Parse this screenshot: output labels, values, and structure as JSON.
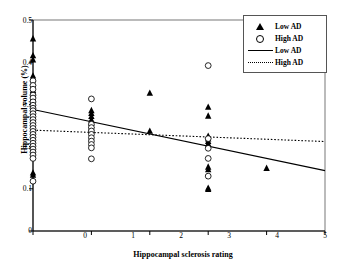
{
  "chart_data": {
    "type": "scatter",
    "title": "",
    "xlabel": "Hippocampal sclerosis rating",
    "ylabel": "Hippocampal volume (%)",
    "xlim": [
      0,
      5
    ],
    "ylim": [
      0,
      0.5
    ],
    "xticks": [
      "0",
      "1",
      "2",
      "3",
      "4",
      "5"
    ],
    "yticks": [
      "0",
      "0.1",
      "0.2",
      "0.3",
      "0.4",
      "0.5"
    ],
    "grid": false,
    "legend_position": "top-right",
    "legend": [
      {
        "label": "Low AD",
        "marker": "filled-triangle",
        "kind": "marker"
      },
      {
        "label": "High AD",
        "marker": "open-circle",
        "kind": "marker"
      },
      {
        "label": "Low AD",
        "marker": "solid-line",
        "kind": "line"
      },
      {
        "label": "High AD",
        "marker": "dotted-line",
        "kind": "line"
      }
    ],
    "series": [
      {
        "name": "Low AD",
        "marker": "filled-triangle",
        "points": [
          [
            0,
            0.455
          ],
          [
            0,
            0.415
          ],
          [
            0,
            0.405
          ],
          [
            0,
            0.367
          ],
          [
            0,
            0.36
          ],
          [
            0,
            0.333
          ],
          [
            0,
            0.327
          ],
          [
            0,
            0.31
          ],
          [
            0,
            0.302
          ],
          [
            0,
            0.296
          ],
          [
            0,
            0.29
          ],
          [
            0,
            0.285
          ],
          [
            0,
            0.137
          ],
          [
            0,
            0.132
          ],
          [
            1,
            0.285
          ],
          [
            1,
            0.278
          ],
          [
            1,
            0.271
          ],
          [
            1,
            0.263
          ],
          [
            1,
            0.256
          ],
          [
            1,
            0.25
          ],
          [
            1,
            0.244
          ],
          [
            1,
            0.236
          ],
          [
            2,
            0.326
          ],
          [
            2,
            0.236
          ],
          [
            3,
            0.293
          ],
          [
            3,
            0.272
          ],
          [
            3,
            0.224
          ],
          [
            3,
            0.218
          ],
          [
            3,
            0.212
          ],
          [
            3,
            0.206
          ],
          [
            3,
            0.151
          ],
          [
            3,
            0.145
          ],
          [
            3,
            0.101
          ],
          [
            3,
            0.098
          ],
          [
            4,
            0.148
          ]
        ]
      },
      {
        "name": "High AD",
        "marker": "open-circle",
        "points": [
          [
            0,
            0.356
          ],
          [
            0,
            0.345
          ],
          [
            0,
            0.336
          ],
          [
            0,
            0.322
          ],
          [
            0,
            0.315
          ],
          [
            0,
            0.306
          ],
          [
            0,
            0.298
          ],
          [
            0,
            0.291
          ],
          [
            0,
            0.285
          ],
          [
            0,
            0.278
          ],
          [
            0,
            0.271
          ],
          [
            0,
            0.264
          ],
          [
            0,
            0.257
          ],
          [
            0,
            0.25
          ],
          [
            0,
            0.243
          ],
          [
            0,
            0.236
          ],
          [
            0,
            0.229
          ],
          [
            0,
            0.222
          ],
          [
            0,
            0.215
          ],
          [
            0,
            0.208
          ],
          [
            0,
            0.201
          ],
          [
            0,
            0.194
          ],
          [
            0,
            0.187
          ],
          [
            0,
            0.18
          ],
          [
            0,
            0.172
          ],
          [
            0,
            0.118
          ],
          [
            1,
            0.313
          ],
          [
            1,
            0.253
          ],
          [
            1,
            0.245
          ],
          [
            1,
            0.237
          ],
          [
            1,
            0.229
          ],
          [
            1,
            0.221
          ],
          [
            1,
            0.213
          ],
          [
            1,
            0.205
          ],
          [
            1,
            0.197
          ],
          [
            1,
            0.171
          ],
          [
            3,
            0.392
          ],
          [
            3,
            0.219
          ],
          [
            3,
            0.196
          ],
          [
            3,
            0.172
          ],
          [
            3,
            0.13
          ]
        ]
      }
    ],
    "trendlines": [
      {
        "name": "Low AD",
        "style": "solid",
        "x": [
          0,
          5
        ],
        "y": [
          0.288,
          0.143
        ]
      },
      {
        "name": "High AD",
        "style": "dotted",
        "x": [
          0,
          5
        ],
        "y": [
          0.239,
          0.212
        ]
      }
    ]
  },
  "colors": {
    "foreground": "#000000",
    "background": "#ffffff",
    "axis": "#000000",
    "frame": "#555555"
  }
}
